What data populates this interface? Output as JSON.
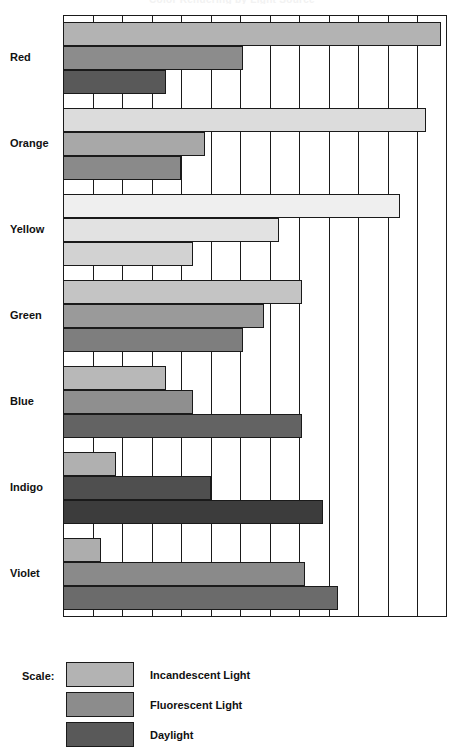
{
  "chart_data": {
    "type": "bar",
    "orientation": "horizontal",
    "title": "Color Rendering by Light Source",
    "categories": [
      "Red",
      "Orange",
      "Yellow",
      "Green",
      "Blue",
      "Indigo",
      "Violet"
    ],
    "series": [
      {
        "name": "Incandescent Light",
        "color": "#b3b3b3",
        "values": [
          12.8,
          12.3,
          11.4,
          8.1,
          3.5,
          1.8,
          1.3
        ]
      },
      {
        "name": "Fluorescent Light",
        "color": "#8c8c8c",
        "values": [
          6.1,
          4.8,
          7.3,
          6.8,
          4.4,
          5.0,
          8.2
        ]
      },
      {
        "name": "Daylight",
        "color": "#595959",
        "values": [
          3.5,
          4.0,
          4.4,
          6.1,
          8.1,
          8.8,
          9.3
        ]
      }
    ],
    "series_fill_overrides": {
      "Orange": {
        "Incandescent Light": "#dcdcdc",
        "Fluorescent Light": "#a8a8a8",
        "Daylight": "#8a8a8a"
      },
      "Yellow": {
        "Incandescent Light": "#efefef",
        "Fluorescent Light": "#e2e2e2",
        "Daylight": "#d2d2d2"
      },
      "Green": {
        "Incandescent Light": "#c4c4c4",
        "Fluorescent Light": "#9a9a9a",
        "Daylight": "#7e7e7e"
      },
      "Blue": {
        "Incandescent Light": "#b8b8b8",
        "Fluorescent Light": "#8f8f8f",
        "Daylight": "#636363"
      },
      "Indigo": {
        "Incandescent Light": "#b0b0b0",
        "Fluorescent Light": "#4f4f4f",
        "Daylight": "#3c3c3c"
      },
      "Violet": {
        "Incandescent Light": "#adadad",
        "Fluorescent Light": "#8a8a8a",
        "Daylight": "#6b6b6b"
      }
    },
    "xlabel": "",
    "ylabel": "",
    "xlim": [
      0,
      13
    ],
    "gridlines": 13,
    "grid": true,
    "legend_position": "bottom-left"
  },
  "legend": {
    "title": "Scale:",
    "entries": [
      {
        "label": "Incandescent Light",
        "color": "#b3b3b3"
      },
      {
        "label": "Fluorescent Light",
        "color": "#8c8c8c"
      },
      {
        "label": "Daylight",
        "color": "#595959"
      }
    ]
  }
}
